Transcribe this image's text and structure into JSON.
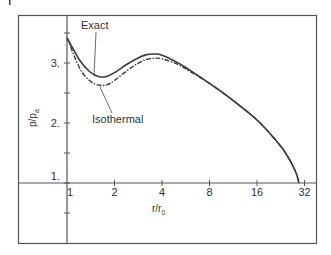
{
  "chart_data": {
    "type": "line",
    "title": "",
    "xlabel": "r/r0",
    "xlabel_main": "r/r",
    "xlabel_sub": "0",
    "ylabel": "p/pa",
    "ylabel_main": "p/p",
    "ylabel_sub": "a",
    "xscale": "log2",
    "xlim": [
      1,
      34
    ],
    "ylim": [
      0,
      3.8
    ],
    "x_ticks": [
      1,
      2,
      4,
      8,
      16,
      32
    ],
    "x_tick_labels": [
      "1",
      "2",
      "4",
      "8",
      "16",
      "32"
    ],
    "y_ticks": [
      0.5,
      1.0,
      1.5,
      2.0,
      2.5,
      3.0,
      3.5
    ],
    "y_tick_labels": [
      {
        "value": 3.0,
        "label": "3."
      },
      {
        "value": 2.0,
        "label": "2."
      },
      {
        "value": 1.0,
        "label": "1."
      }
    ],
    "grid": false,
    "series": [
      {
        "name": "Exact",
        "style": "solid",
        "x": [
          1.0,
          1.2,
          1.4,
          1.6,
          1.8,
          2.0,
          2.4,
          2.8,
          3.2,
          3.6,
          4.0,
          5.0,
          6.0,
          8.0,
          10.0,
          12.0,
          16.0,
          20.0,
          24.0,
          28.0,
          29.5
        ],
        "y": [
          3.42,
          3.05,
          2.85,
          2.77,
          2.78,
          2.84,
          2.98,
          3.08,
          3.14,
          3.15,
          3.13,
          3.01,
          2.88,
          2.66,
          2.48,
          2.32,
          2.05,
          1.78,
          1.52,
          1.2,
          1.0
        ]
      },
      {
        "name": "Isothermal",
        "style": "dash-dot",
        "x": [
          1.0,
          1.2,
          1.4,
          1.6,
          1.8,
          2.0,
          2.4,
          2.8,
          3.2,
          3.6,
          4.0,
          5.0,
          6.0,
          8.0,
          10.0,
          12.0,
          16.0,
          20.0,
          24.0,
          28.0,
          29.5
        ],
        "y": [
          3.42,
          2.92,
          2.7,
          2.63,
          2.64,
          2.71,
          2.87,
          2.99,
          3.06,
          3.08,
          3.07,
          2.98,
          2.86,
          2.66,
          2.48,
          2.32,
          2.05,
          1.78,
          1.52,
          1.2,
          1.0
        ]
      }
    ],
    "annotations": [
      {
        "text": "Exact",
        "points_to": "Exact curve near minimum"
      },
      {
        "text": "Isothermal",
        "points_to": "Isothermal curve near minimum"
      }
    ],
    "legend": "none (inline labels with leader lines)"
  },
  "colors": {
    "line": "#3a3a3a",
    "frame": "#555555",
    "text": "#333333"
  }
}
